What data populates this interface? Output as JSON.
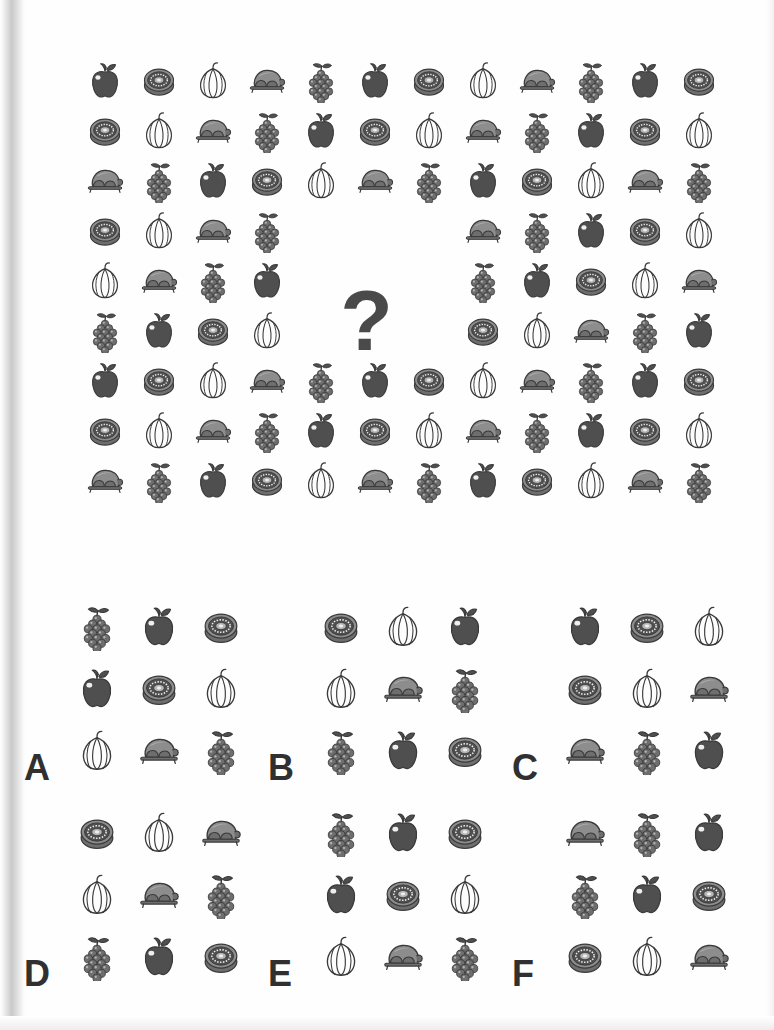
{
  "puzzle": {
    "type": "icon-sequence-matrix",
    "question_mark": "?",
    "icon_vocabulary": [
      "apple",
      "kiwi",
      "garlic",
      "turkey",
      "grapes"
    ],
    "icon_colors": {
      "dark_fill": "#4f4f4f",
      "mid_fill": "#6e6e6e",
      "light_fill": "#8d8d8d",
      "pale_fill": "#b5b5b5",
      "outline": "#3a3a3a",
      "highlight": "#efefef",
      "page_background": "#fefefe",
      "letter_color": "#303030",
      "question_mark_color": "#4a4a4a"
    },
    "matrix": {
      "columns": 12,
      "rows": 9,
      "missing_block": {
        "rows": [
          4,
          5,
          6
        ],
        "columns": [
          5,
          6,
          7
        ]
      },
      "grid": [
        [
          "apple",
          "kiwi",
          "garlic",
          "turkey",
          "grapes",
          "apple",
          "kiwi",
          "garlic",
          "turkey",
          "grapes",
          "apple",
          "kiwi"
        ],
        [
          "kiwi",
          "garlic",
          "turkey",
          "grapes",
          "apple",
          "kiwi",
          "garlic",
          "turkey",
          "grapes",
          "apple",
          "kiwi",
          "garlic"
        ],
        [
          "turkey",
          "grapes",
          "apple",
          "kiwi",
          "garlic",
          "turkey",
          "grapes",
          "apple",
          "kiwi",
          "garlic",
          "turkey",
          "grapes"
        ],
        [
          "kiwi",
          "garlic",
          "turkey",
          "grapes",
          null,
          null,
          null,
          "turkey",
          "grapes",
          "apple",
          "kiwi",
          "garlic"
        ],
        [
          "garlic",
          "turkey",
          "grapes",
          "apple",
          null,
          null,
          null,
          "grapes",
          "apple",
          "kiwi",
          "garlic",
          "turkey"
        ],
        [
          "grapes",
          "apple",
          "kiwi",
          "garlic",
          null,
          null,
          null,
          "kiwi",
          "garlic",
          "turkey",
          "grapes",
          "apple"
        ],
        [
          "apple",
          "kiwi",
          "garlic",
          "turkey",
          "grapes",
          "apple",
          "kiwi",
          "garlic",
          "turkey",
          "grapes",
          "apple",
          "kiwi"
        ],
        [
          "kiwi",
          "garlic",
          "turkey",
          "grapes",
          "apple",
          "kiwi",
          "garlic",
          "turkey",
          "grapes",
          "apple",
          "kiwi",
          "garlic"
        ],
        [
          "turkey",
          "grapes",
          "apple",
          "kiwi",
          "garlic",
          "turkey",
          "grapes",
          "apple",
          "kiwi",
          "garlic",
          "turkey",
          "grapes"
        ]
      ]
    },
    "options": [
      {
        "letter": "A",
        "grid": [
          [
            "grapes",
            "apple",
            "kiwi"
          ],
          [
            "apple",
            "kiwi",
            "garlic"
          ],
          [
            "garlic",
            "turkey",
            "grapes"
          ]
        ]
      },
      {
        "letter": "B",
        "grid": [
          [
            "kiwi",
            "garlic",
            "apple"
          ],
          [
            "garlic",
            "turkey",
            "grapes"
          ],
          [
            "grapes",
            "apple",
            "kiwi"
          ]
        ]
      },
      {
        "letter": "C",
        "grid": [
          [
            "apple",
            "kiwi",
            "garlic"
          ],
          [
            "kiwi",
            "garlic",
            "turkey"
          ],
          [
            "turkey",
            "grapes",
            "apple"
          ]
        ]
      },
      {
        "letter": "D",
        "grid": [
          [
            "kiwi",
            "garlic",
            "turkey"
          ],
          [
            "garlic",
            "turkey",
            "grapes"
          ],
          [
            "grapes",
            "apple",
            "kiwi"
          ]
        ]
      },
      {
        "letter": "E",
        "grid": [
          [
            "grapes",
            "apple",
            "kiwi"
          ],
          [
            "apple",
            "kiwi",
            "garlic"
          ],
          [
            "garlic",
            "turkey",
            "grapes"
          ]
        ]
      },
      {
        "letter": "F",
        "grid": [
          [
            "turkey",
            "grapes",
            "apple"
          ],
          [
            "grapes",
            "apple",
            "kiwi"
          ],
          [
            "kiwi",
            "garlic",
            "turkey"
          ]
        ]
      }
    ]
  },
  "layout": {
    "matrix_origin": {
      "x": 82,
      "y": 58
    },
    "matrix_step": {
      "x": 54,
      "y": 50
    },
    "option_positions": [
      {
        "letter": "A",
        "x": 18,
        "y": 0
      },
      {
        "letter": "B",
        "x": 262,
        "y": 0
      },
      {
        "letter": "C",
        "x": 506,
        "y": 0
      },
      {
        "letter": "D",
        "x": 18,
        "y": 206
      },
      {
        "letter": "E",
        "x": 262,
        "y": 206
      },
      {
        "letter": "F",
        "x": 506,
        "y": 206
      }
    ]
  }
}
